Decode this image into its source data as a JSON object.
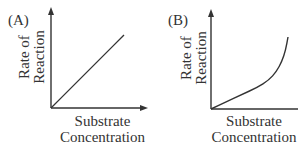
{
  "figure": {
    "panels": [
      {
        "label": "(A)",
        "ylabel_line1": "Rate of",
        "ylabel_line2": "Reaction",
        "xlabel_line1": "Substrate",
        "xlabel_line2": "Concentration"
      },
      {
        "label": "(B)",
        "ylabel_line1": "Rate of",
        "ylabel_line2": "Reaction",
        "xlabel_line1": "Substrate",
        "xlabel_line2": "Concentration"
      }
    ],
    "line_color": "#333333",
    "axis_color": "#333333"
  },
  "chart_data": [
    {
      "type": "line",
      "title": "(A)",
      "xlabel": "Substrate Concentration",
      "ylabel": "Rate of Reaction",
      "grid": false,
      "description": "Linear increase: rate proportional to substrate concentration",
      "x": [
        0,
        0.25,
        0.5,
        0.75,
        1.0
      ],
      "series": [
        {
          "name": "rate",
          "values": [
            0,
            0.25,
            0.5,
            0.75,
            1.0
          ]
        }
      ]
    },
    {
      "type": "line",
      "title": "(B)",
      "xlabel": "Substrate Concentration",
      "ylabel": "Rate of Reaction",
      "grid": false,
      "description": "Gradual near-linear rise followed by sharp upward (exponential-like) increase",
      "x": [
        0,
        0.2,
        0.4,
        0.6,
        0.75,
        0.85,
        0.92,
        0.97,
        1.0
      ],
      "series": [
        {
          "name": "rate",
          "values": [
            0,
            0.1,
            0.2,
            0.3,
            0.4,
            0.52,
            0.66,
            0.82,
            1.0
          ]
        }
      ]
    }
  ]
}
